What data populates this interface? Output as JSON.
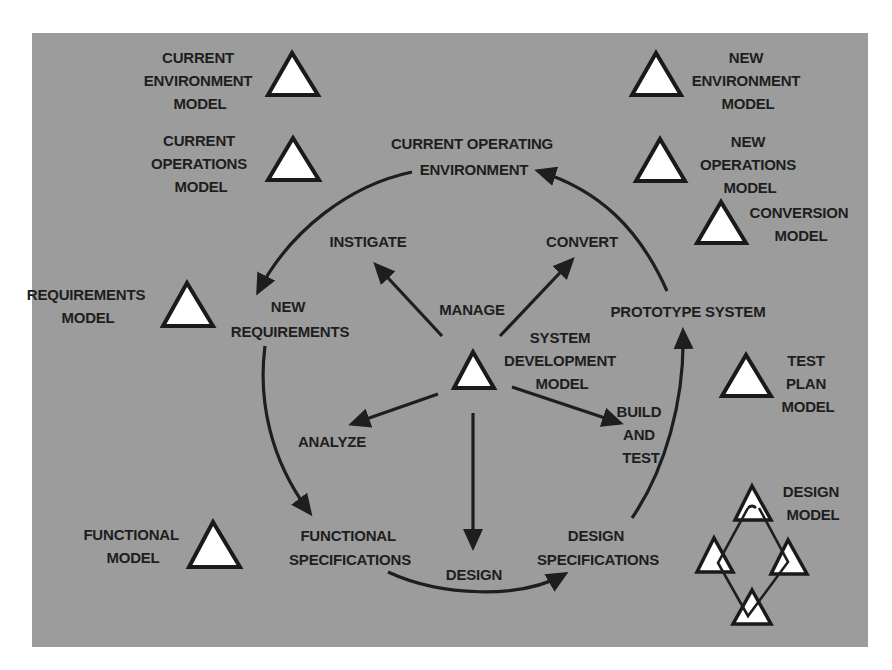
{
  "diagram": {
    "title": "",
    "center": {
      "label_lines": [
        "SYSTEM",
        "DEVELOPMENT",
        "MODEL"
      ],
      "activities": {
        "instigate": "INSTIGATE",
        "manage": "MANAGE",
        "convert": "CONVERT",
        "analyze": "ANALYZE",
        "design": "DESIGN",
        "build_lines": [
          "BUILD",
          "AND",
          "TEST"
        ]
      }
    },
    "cycle_states": {
      "current_operating_lines": [
        "CURRENT OPERATING",
        "ENVIRONMENT"
      ],
      "new_requirements_lines": [
        "NEW",
        "REQUIREMENTS"
      ],
      "functional_spec_lines": [
        "FUNCTIONAL",
        "SPECIFICATIONS"
      ],
      "design_spec_lines": [
        "DESIGN",
        "SPECIFICATIONS"
      ],
      "prototype": "PROTOTYPE SYSTEM"
    },
    "models": {
      "current_environment": [
        "CURRENT",
        "ENVIRONMENT",
        "MODEL"
      ],
      "current_operations": [
        "CURRENT",
        "OPERATIONS",
        "MODEL"
      ],
      "requirements": [
        "REQUIREMENTS",
        "MODEL"
      ],
      "functional": [
        "FUNCTIONAL",
        "MODEL"
      ],
      "new_environment": [
        "NEW",
        "ENVIRONMENT",
        "MODEL"
      ],
      "new_operations": [
        "NEW",
        "OPERATIONS",
        "MODEL"
      ],
      "conversion": [
        "CONVERSION",
        "MODEL"
      ],
      "test_plan": [
        "TEST",
        "PLAN",
        "MODEL"
      ],
      "design": [
        "DESIGN",
        "MODEL"
      ]
    },
    "icons": {
      "model": "triangle-icon",
      "design_model": "triangle-network-icon"
    },
    "colors": {
      "panel": "#9c9c9c",
      "ink": "#1e1e1e",
      "triangle_fill": "#ffffff"
    }
  }
}
